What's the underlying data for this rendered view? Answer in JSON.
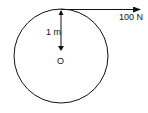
{
  "diagram": {
    "type": "free-body diagram",
    "elements": {
      "circle": {
        "center_label": "O"
      },
      "radius": {
        "label": "1 m"
      },
      "force": {
        "label": "100 N",
        "direction": "tangential, right"
      }
    }
  }
}
